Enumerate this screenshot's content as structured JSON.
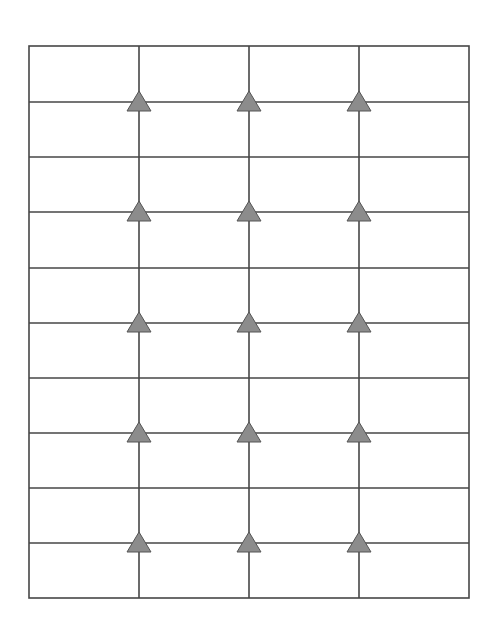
{
  "diagram": {
    "type": "grid-with-markers",
    "frame": {
      "x": 29,
      "y": 46,
      "width": 440,
      "height": 552
    },
    "vertical_lines_x": [
      139,
      249,
      359
    ],
    "horizontal_lines_y": [
      102,
      157,
      212,
      268,
      323,
      378,
      433,
      488,
      543
    ],
    "rows": 10,
    "columns": 4,
    "marker": {
      "shape": "triangle",
      "fill": "#8c8c8c",
      "stroke": "#555555",
      "half_width": 12,
      "height": 20
    },
    "marker_rows_y": [
      102,
      212,
      323,
      433,
      543
    ],
    "marker_cols_x": [
      139,
      249,
      359
    ],
    "line_color": "#464646",
    "line_width": 1.6,
    "background": "#ffffff"
  }
}
